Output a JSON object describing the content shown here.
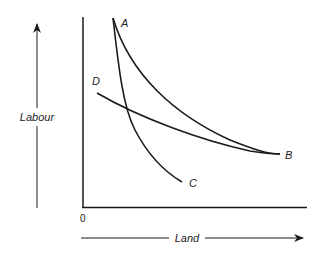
{
  "diagram": {
    "type": "isoquant-curves",
    "axes": {
      "y_label": "Labour",
      "x_label": "Land",
      "origin_label": "0"
    },
    "curves": [
      {
        "id": "AB",
        "start_label": "A",
        "end_label": "B",
        "description": "convex curve from A sweeping down to B"
      },
      {
        "id": "AC",
        "start_label": "A",
        "end_label": "C",
        "description": "steep curve from A down to C"
      },
      {
        "id": "DB",
        "start_label": "D",
        "end_label": "B",
        "description": "flatter curve from D to B, crossing AC"
      }
    ],
    "labels": {
      "a": "A",
      "b": "B",
      "c": "C",
      "d": "D"
    },
    "colors": {
      "line": "#1a1a1a",
      "background": "#ffffff"
    }
  }
}
